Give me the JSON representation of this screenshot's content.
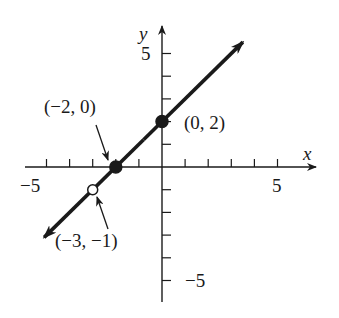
{
  "chart_data": {
    "type": "line",
    "title": "",
    "xlabel": "x",
    "ylabel": "y",
    "xlim": [
      -6,
      6.5
    ],
    "ylim": [
      -6,
      6
    ],
    "x_tick_step": 1,
    "y_tick_step": 1,
    "x_tick_labels": [
      {
        "value": -5,
        "label": "−5"
      },
      {
        "value": 5,
        "label": "5"
      }
    ],
    "y_tick_labels": [
      {
        "value": 5,
        "label": "5"
      },
      {
        "value": -5,
        "label": "−5"
      }
    ],
    "grid": false,
    "series": [
      {
        "name": "y = x + 2 (x ≠ −3)",
        "equation": "y = x + 2",
        "x": [
          -5.1,
          3.5
        ],
        "y": [
          -3.1,
          5.5
        ],
        "arrows_both_ends": true
      }
    ],
    "points": [
      {
        "x": -2,
        "y": 0,
        "style": "filled",
        "label": "(−2, 0)"
      },
      {
        "x": 0,
        "y": 2,
        "style": "filled",
        "label": "(0, 2)"
      },
      {
        "x": -3,
        "y": -1,
        "style": "open",
        "label": "(−3, −1)"
      }
    ]
  },
  "labels": {
    "x_axis": "x",
    "y_axis": "y",
    "x_neg5": "−5",
    "x_pos5": "5",
    "y_pos5": "5",
    "y_neg5": "−5",
    "pt_a": "(−2, 0)",
    "pt_b": "(0, 2)",
    "pt_c": "(−3, −1)"
  },
  "colors": {
    "ink": "#1a1a1a",
    "background": "#ffffff"
  }
}
